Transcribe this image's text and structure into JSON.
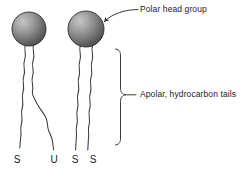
{
  "figure": {
    "background_color": "#ffffff",
    "stroke_color": "#333333",
    "text_color": "#1a1a1a",
    "sphere": {
      "highlight_color": "#c0c0c0",
      "mid_color": "#8a8a8a",
      "shadow_color": "#4a4a4a",
      "outline_color": "#2b2b2b"
    }
  },
  "annotations": {
    "polar_head": "Polar head group",
    "apolar_tails": "Apolar, hydrocarbon tails"
  },
  "chain_labels": [
    {
      "id": "s1",
      "text": "S"
    },
    {
      "id": "u1",
      "text": "U"
    },
    {
      "id": "s2",
      "text": "S"
    },
    {
      "id": "s3",
      "text": "S"
    }
  ],
  "molecules": [
    {
      "name": "saturated-unsaturated-lipid",
      "head_center": {
        "x": 29,
        "y": 29
      },
      "head_radius": 17,
      "tails": [
        {
          "type": "saturated",
          "label": "S"
        },
        {
          "type": "unsaturated",
          "label": "U"
        }
      ]
    },
    {
      "name": "disaturated-lipid",
      "head_center": {
        "x": 86,
        "y": 29
      },
      "head_radius": 18,
      "tails": [
        {
          "type": "saturated",
          "label": "S"
        },
        {
          "type": "saturated",
          "label": "S"
        }
      ]
    }
  ]
}
